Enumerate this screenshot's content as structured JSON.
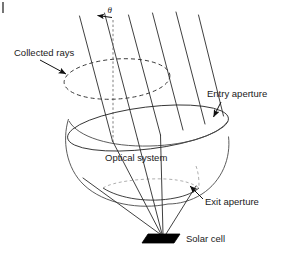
{
  "figure": {
    "background_color": "#ffffff",
    "line_color": "#2a2a2a",
    "cell_color": "#000000",
    "width": 285,
    "height": 255
  },
  "labels": {
    "angle": "θ",
    "collected_rays": "Collected rays",
    "entry_aperture": "Entry aperture",
    "optical_system": "Optical system",
    "exit_aperture": "Exit aperture",
    "solar_cell": "Solar cell"
  },
  "elements": {
    "incoming_ray_count": 6,
    "converging_ray_count": 5,
    "optical_axis_style": "dashed-vertical",
    "collected_rays_outline": "dashed-ellipse",
    "entry_aperture_outline": "solid-ellipse",
    "exit_aperture_outline": "solid-arc-with-dashed-back",
    "solar_cell_shape": "filled-parallelogram"
  },
  "icons": {
    "angle_arrow": "left-arrow-icon",
    "collected_rays_pointer": "arrow-icon",
    "entry_aperture_pointer": "arrow-icon",
    "exit_aperture_pointer": "arrow-icon",
    "corner_tick": "crop-tick-icon"
  }
}
